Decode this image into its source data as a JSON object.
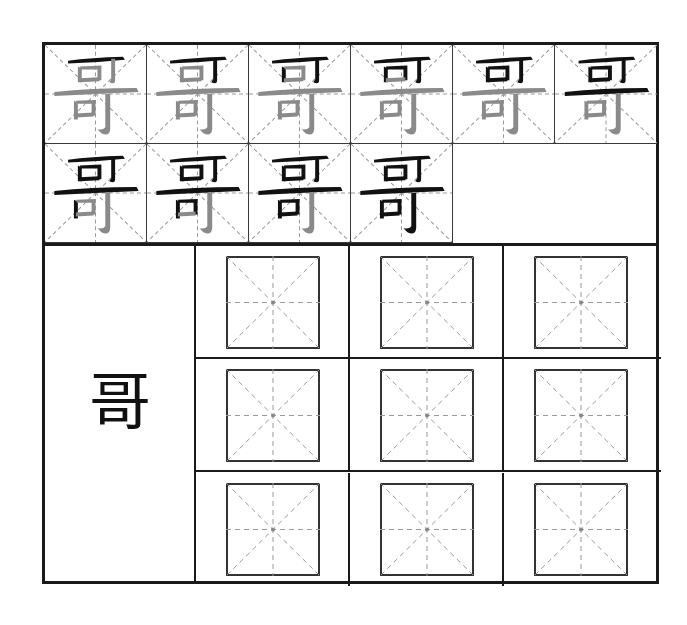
{
  "worksheet": {
    "character": "哥",
    "stroke_count": 10,
    "stroke_order_steps": [
      {
        "step": 1,
        "completed_strokes": 1
      },
      {
        "step": 2,
        "completed_strokes": 2
      },
      {
        "step": 3,
        "completed_strokes": 3
      },
      {
        "step": 4,
        "completed_strokes": 4
      },
      {
        "step": 5,
        "completed_strokes": 5
      },
      {
        "step": 6,
        "completed_strokes": 6
      },
      {
        "step": 7,
        "completed_strokes": 7
      },
      {
        "step": 8,
        "completed_strokes": 8
      },
      {
        "step": 9,
        "completed_strokes": 9
      },
      {
        "step": 10,
        "completed_strokes": 10
      }
    ],
    "model_character": "哥",
    "practice_grid": {
      "rows": 3,
      "columns": 3,
      "box_style": "mi-zi-ge"
    },
    "colors": {
      "ink": "#111111",
      "remaining_stroke": "#8a8a8a",
      "border": "#1a1a1a",
      "guide_line": "#9a9a9a"
    }
  }
}
